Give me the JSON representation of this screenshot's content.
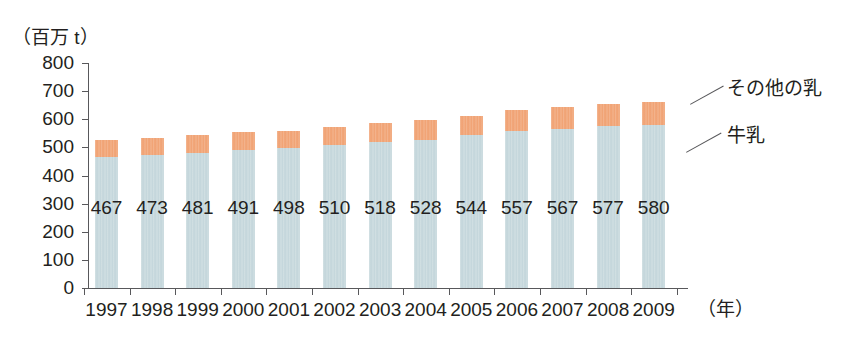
{
  "chart_data": {
    "type": "bar",
    "stacked": true,
    "title": "",
    "subtitle": "",
    "unit_label": "（百万 t）",
    "xlabel": "（年）",
    "ylabel": "",
    "grid": false,
    "legend_position": "right-annotation",
    "categories": [
      "1997",
      "1998",
      "1999",
      "2000",
      "2001",
      "2002",
      "2003",
      "2004",
      "2005",
      "2006",
      "2007",
      "2008",
      "2009"
    ],
    "ylim": [
      0,
      800
    ],
    "ytick_step": 100,
    "yticks": [
      "800",
      "700",
      "600",
      "500",
      "400",
      "300",
      "200",
      "100",
      "0"
    ],
    "series": [
      {
        "name": "牛乳",
        "color": "#c2d5da",
        "values": [
          467,
          473,
          481,
          491,
          498,
          510,
          518,
          528,
          544,
          557,
          567,
          577,
          580
        ],
        "labels": [
          "467",
          "473",
          "481",
          "491",
          "498",
          "510",
          "518",
          "528",
          "544",
          "557",
          "567",
          "577",
          "580"
        ]
      },
      {
        "name": "その他の乳",
        "color": "#f0a070",
        "values": [
          60,
          62,
          63,
          63,
          62,
          62,
          67,
          68,
          69,
          75,
          76,
          76,
          83
        ]
      }
    ],
    "totals": [
      527,
      535,
      544,
      554,
      560,
      572,
      585,
      596,
      613,
      632,
      643,
      653,
      663
    ],
    "annotations": [
      {
        "name": "その他の乳",
        "target": "orange-segment-2009"
      },
      {
        "name": "牛乳",
        "target": "blue-segment-2009"
      }
    ]
  },
  "legend": {
    "other_milk": "その他の乳",
    "cow_milk": "牛乳"
  },
  "colors": {
    "cow_milk": "#c2d5da",
    "other_milk": "#f0a070",
    "axis": "#58585b",
    "text": "#231f20",
    "background": "#ffffff"
  }
}
